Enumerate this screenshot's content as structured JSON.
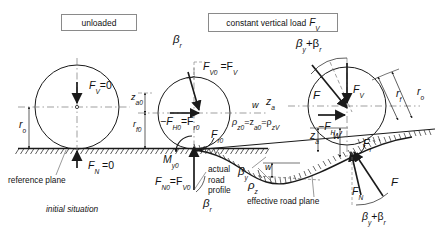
{
  "figure": {
    "domain": "engineering-diagram",
    "colors": {
      "stroke": "#1a1a1a",
      "hatch": "#1a1a1a",
      "dash": "#555555",
      "box_border": "#8a8a8a",
      "background": "#ffffff"
    }
  },
  "headers": [
    {
      "id": "unloaded",
      "label": "unloaded"
    },
    {
      "id": "constant-load",
      "label": "constant vertical load",
      "symbol": "F",
      "sub": "V"
    }
  ],
  "captions": [
    {
      "id": "reference-plane",
      "text": "reference plane"
    },
    {
      "id": "initial-situation",
      "text": "initial situation"
    },
    {
      "id": "actual-road-profile",
      "text": "actual\nroad\nprofile",
      "lines": [
        "actual",
        "road",
        "profile"
      ]
    },
    {
      "id": "effective-road-plane",
      "text": "effective road plane"
    }
  ],
  "symbols": {
    "left_panel": [
      {
        "id": "fv-zero",
        "base": "F",
        "sub": "V",
        "tail": "=0"
      },
      {
        "id": "r-o-left",
        "base": "r",
        "sub": "o",
        "tail": ""
      },
      {
        "id": "fn-zero",
        "base": "F",
        "sub": "N",
        "tail": " =0"
      }
    ],
    "middle_panel": [
      {
        "id": "beta-r-top",
        "base": "β",
        "sub": "r",
        "tail": ""
      },
      {
        "id": "fv0-fv",
        "base": "F",
        "sub": "V0",
        "tail": " =F",
        "tail_sub": "V"
      },
      {
        "id": "z-a0",
        "base": "z",
        "sub": "a0",
        "tail": ""
      },
      {
        "id": "r-f0",
        "base": "r",
        "sub": "f0",
        "tail": ""
      },
      {
        "id": "minus-fh0-fr0",
        "base": "−F",
        "sub": "H0",
        "tail": "=F",
        "tail_sub": "r0"
      },
      {
        "id": "m-y0",
        "base": "M",
        "sub": "y0",
        "tail": ""
      },
      {
        "id": "f-r0",
        "base": "F",
        "sub": "r0",
        "tail": ""
      },
      {
        "id": "fn0-fv0",
        "base": "F",
        "sub": "N0",
        "tail": "=F",
        "tail_sub": "V0"
      },
      {
        "id": "beta-r-bottom",
        "base": "β",
        "sub": "r",
        "tail": ""
      },
      {
        "id": "w-mid",
        "base": "w",
        "sub": "",
        "tail": ""
      },
      {
        "id": "z-a-mid",
        "base": "z",
        "sub": "a",
        "tail": ""
      },
      {
        "id": "rho-z0-za0-rhozv",
        "base": "ρ",
        "sub": "z0",
        "tail": "=z",
        "tail_sub": "a0",
        "tail2": "=ρ",
        "tail2_sub": "zV"
      }
    ],
    "right_panel": [
      {
        "id": "beta-y-plus-beta-r-top",
        "base": "β",
        "sub": "y",
        "tail": "+β",
        "tail_sub": "r"
      },
      {
        "id": "f-resultant-top",
        "base": "F",
        "sub": "",
        "tail": ""
      },
      {
        "id": "f-v-right",
        "base": "F",
        "sub": "V",
        "tail": ""
      },
      {
        "id": "r-f-right",
        "base": "r",
        "sub": "f",
        "tail": ""
      },
      {
        "id": "r-o-right",
        "base": "r",
        "sub": "o",
        "tail": ""
      },
      {
        "id": "minus-f-h",
        "base": "−F",
        "sub": "H",
        "tail": ""
      },
      {
        "id": "f-r-right",
        "base": "F",
        "sub": "r",
        "tail": ""
      },
      {
        "id": "f-n-right",
        "base": "F",
        "sub": "N",
        "tail": ""
      },
      {
        "id": "f-right-lower",
        "base": "F",
        "sub": "",
        "tail": ""
      },
      {
        "id": "beta-y-plus-beta-r-bottom",
        "base": "β",
        "sub": "y",
        "tail": "+β",
        "tail_sub": "r"
      },
      {
        "id": "z-a-right",
        "base": "z",
        "sub": "a",
        "tail": ""
      },
      {
        "id": "w-prime-right",
        "base": "w",
        "sub": "",
        "tail": "′"
      },
      {
        "id": "w-profile",
        "base": "w",
        "sub": "",
        "tail": ""
      },
      {
        "id": "beta-y-road",
        "base": "β",
        "sub": "y",
        "tail": ""
      },
      {
        "id": "rho-z",
        "base": "ρ",
        "sub": "z",
        "tail": ""
      }
    ]
  },
  "text_values": {
    "unloaded": "unloaded",
    "constant_vertical_load": "constant vertical load",
    "reference_plane": "reference plane",
    "initial_situation": "initial situation",
    "actual_line1": "actual",
    "actual_line2": "road",
    "actual_line3": "profile",
    "effective_road_plane": "effective road plane",
    "fv_eq_zero": "=0",
    "fn_eq_zero": " =0",
    "eq": "=",
    "plus": "+"
  }
}
